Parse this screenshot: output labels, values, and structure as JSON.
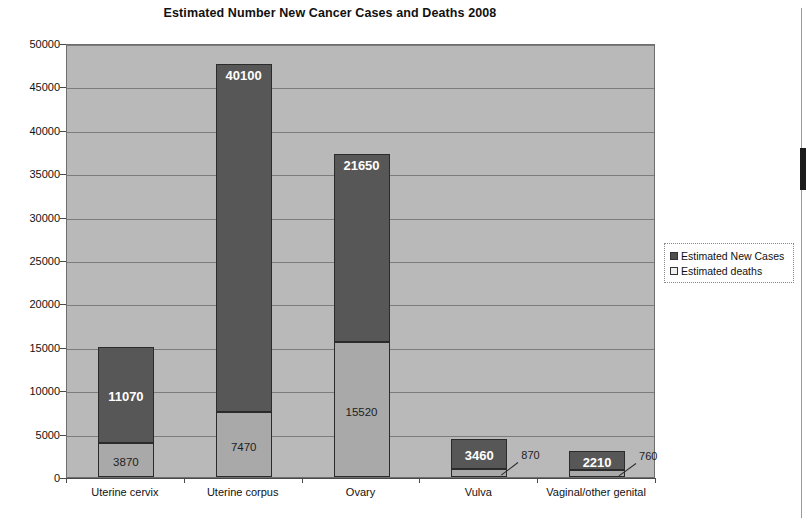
{
  "chart_data": {
    "type": "bar",
    "subtype": "stacked-column",
    "title": "Estimated Number New Cancer Cases and Deaths 2008",
    "xlabel": "",
    "ylabel": "",
    "ylim": [
      0,
      50000
    ],
    "ytick_step": 5000,
    "yticks": [
      0,
      5000,
      10000,
      15000,
      20000,
      25000,
      30000,
      35000,
      40000,
      45000,
      50000
    ],
    "ytick_labels": [
      "0",
      "5000",
      "10000",
      "15000",
      "20000",
      "25000",
      "30000",
      "35000",
      "40000",
      "45000",
      "50000"
    ],
    "grid": true,
    "grid_axis": "y",
    "legend_position": "right",
    "categories": [
      "Uterine cervix",
      "Uterine corpus",
      "Ovary",
      "Vulva",
      "Vaginal/other genital"
    ],
    "series": [
      {
        "name": "Estimated New Cases",
        "color": "#575757",
        "values": [
          11070,
          40100,
          21650,
          3460,
          2210
        ],
        "labels": [
          "11070",
          "40100",
          "21650",
          "3460",
          "2210"
        ]
      },
      {
        "name": "Estimated deaths",
        "color": "#a9a9a9",
        "values": [
          3870,
          7470,
          15520,
          870,
          760
        ],
        "labels": [
          "3870",
          "7470",
          "15520",
          "870",
          "760"
        ]
      }
    ],
    "totals": [
      14940,
      47570,
      37170,
      4330,
      2970
    ]
  },
  "legend": {
    "items": [
      {
        "label": "Estimated New Cases",
        "swatch": "dark"
      },
      {
        "label": "Estimated deaths",
        "swatch": "light"
      }
    ]
  },
  "colors": {
    "plot_background": "#b9b9b9",
    "new_cases": "#575757",
    "deaths": "#a9a9a9",
    "gridline": "#7c7c7c",
    "axis": "#4a4a4a"
  }
}
